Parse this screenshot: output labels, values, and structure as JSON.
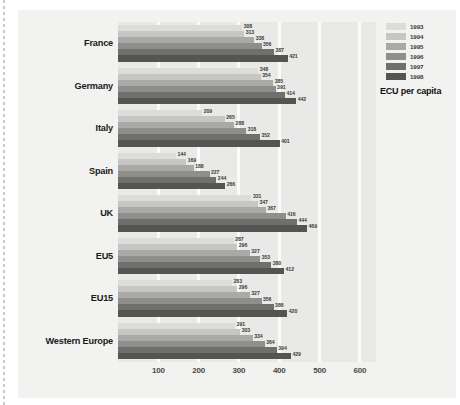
{
  "chart_data": {
    "type": "bar",
    "orientation": "horizontal",
    "title": "",
    "xlabel": "ECU per capita",
    "ylabel": "",
    "xlim": [
      0,
      640
    ],
    "grid": true,
    "legend_position": "top-right",
    "xticks": [
      "100",
      "200",
      "300",
      "400",
      "500",
      "600"
    ],
    "xtick_values": [
      100,
      200,
      300,
      400,
      500,
      600
    ],
    "categories": [
      "France",
      "Germany",
      "Italy",
      "Spain",
      "UK",
      "EU5",
      "EU15",
      "Western Europe"
    ],
    "series": [
      {
        "name": "1993",
        "color": "#dcdcda",
        "values": [
          308,
          348,
          209,
          144,
          331,
          287,
          283,
          291
        ]
      },
      {
        "name": "1994",
        "color": "#c6c6c4",
        "values": [
          313,
          354,
          265,
          169,
          347,
          296,
          296,
          303
        ]
      },
      {
        "name": "1995",
        "color": "#a9a9a7",
        "values": [
          338,
          385,
          288,
          188,
          367,
          327,
          327,
          334
        ]
      },
      {
        "name": "1996",
        "color": "#8e8e8c",
        "values": [
          356,
          391,
          318,
          227,
          416,
          353,
          356,
          364
        ]
      },
      {
        "name": "1997",
        "color": "#6f6f6d",
        "values": [
          387,
          414,
          352,
          244,
          444,
          380,
          386,
          394
        ]
      },
      {
        "name": "1998",
        "color": "#545452",
        "values": [
          421,
          442,
          401,
          266,
          469,
          412,
          420,
          429
        ]
      }
    ]
  },
  "legend": {
    "title": "ECU per capita"
  }
}
